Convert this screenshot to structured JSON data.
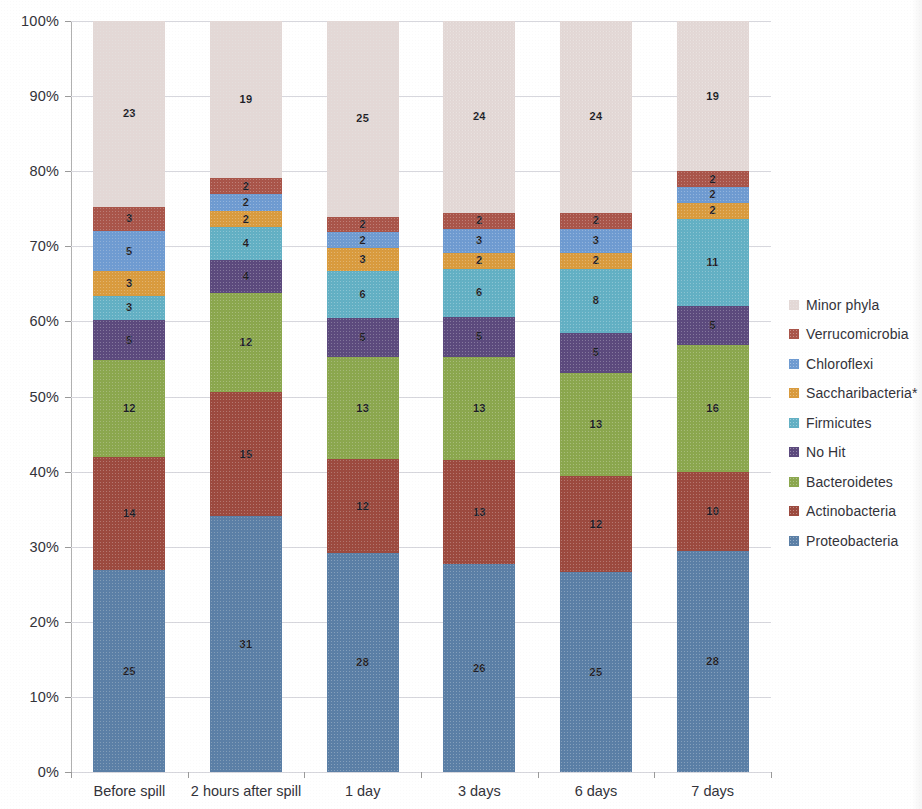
{
  "chart_data": {
    "type": "bar",
    "subtype": "100% stacked column",
    "title": "",
    "xlabel": "",
    "ylabel": "",
    "ylim": [
      0,
      100
    ],
    "y_unit": "%",
    "grid": true,
    "legend_position": "right",
    "y_ticks": [
      "0%",
      "10%",
      "20%",
      "30%",
      "40%",
      "50%",
      "60%",
      "70%",
      "80%",
      "90%",
      "100%"
    ],
    "categories": [
      "Before spill",
      "2 hours after spill",
      "1 day",
      "3 days",
      "6 days",
      "7 days"
    ],
    "series": [
      {
        "name": "Proteobacteria",
        "color": "#5b7fa6",
        "values": [
          25,
          31,
          28,
          26,
          25,
          28
        ]
      },
      {
        "name": "Actinobacteria",
        "color": "#9c4a3f",
        "values": [
          14,
          15,
          12,
          13,
          12,
          10
        ]
      },
      {
        "name": "Bacteroidetes",
        "color": "#8ba74e",
        "values": [
          12,
          12,
          13,
          13,
          13,
          16
        ]
      },
      {
        "name": "No Hit",
        "color": "#5c4a7d",
        "values": [
          5,
          4,
          5,
          5,
          5,
          5
        ]
      },
      {
        "name": "Firmicutes",
        "color": "#63b0c4",
        "values": [
          3,
          4,
          6,
          6,
          8,
          11
        ]
      },
      {
        "name": "Saccharibacteria*",
        "color": "#d99b3e",
        "values": [
          3,
          2,
          3,
          2,
          2,
          2
        ]
      },
      {
        "name": "Chloroflexi",
        "color": "#6f9bd1",
        "values": [
          5,
          2,
          2,
          3,
          3,
          2
        ]
      },
      {
        "name": "Verrucomicrobia",
        "color": "#a9554a",
        "values": [
          3,
          2,
          2,
          2,
          2,
          2
        ]
      },
      {
        "name": "Minor phyla",
        "color": "#e3d8d6",
        "values": [
          23,
          19,
          25,
          24,
          24,
          19
        ]
      }
    ],
    "legend_order": [
      "Minor phyla",
      "Verrucomicrobia",
      "Chloroflexi",
      "Saccharibacteria*",
      "Firmicutes",
      "No Hit",
      "Bacteroidetes",
      "Actinobacteria",
      "Proteobacteria"
    ]
  }
}
